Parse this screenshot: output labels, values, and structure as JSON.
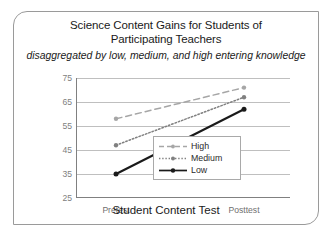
{
  "figure": {
    "title_lines": [
      "Science Content Gains for Students of",
      "Participating Teachers"
    ],
    "subtitle": "disaggregated by low, medium, and high entering knowledge"
  },
  "chart_data": {
    "type": "line",
    "title": "Science Content Gains for Students of Participating Teachers",
    "subtitle": "disaggregated by low, medium, and high entering knowledge",
    "xlabel": "Student Content Test",
    "ylabel": "",
    "categories": [
      "Pretest",
      "Posttest"
    ],
    "ylim": [
      25,
      75
    ],
    "yticks": [
      25,
      35,
      45,
      55,
      65,
      75
    ],
    "ytick_labels": [
      "25",
      "35",
      "45",
      "55",
      "65",
      "75"
    ],
    "xtick_labels": [
      "Pretest",
      "Posttest"
    ],
    "grid": "horizontal",
    "legend_position": "inside-right-lower",
    "series": [
      {
        "name": "High",
        "values": [
          58,
          71
        ],
        "line_style": "dashed",
        "color": "#a6a6a6",
        "marker": "circle"
      },
      {
        "name": "Medium",
        "values": [
          47,
          67
        ],
        "line_style": "dotted",
        "color": "#808080",
        "marker": "circle"
      },
      {
        "name": "Low",
        "values": [
          35,
          62
        ],
        "line_style": "solid",
        "color": "#1a1a1a",
        "marker": "circle"
      }
    ]
  },
  "legend": {
    "items": [
      {
        "label": "High"
      },
      {
        "label": "Medium"
      },
      {
        "label": "Low"
      }
    ]
  },
  "colors": {
    "frame_border": "#9a9a9a",
    "gridline": "#bfbfbf",
    "axis_line": "#808080",
    "text": "#1a1a1a",
    "tick_text": "#808080"
  }
}
